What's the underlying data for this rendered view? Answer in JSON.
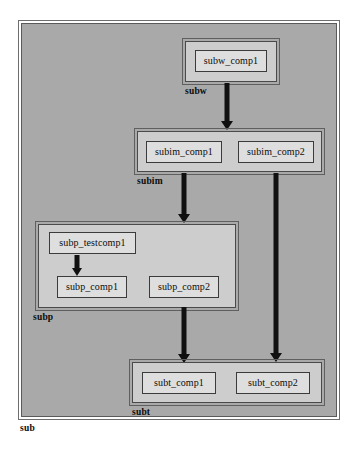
{
  "diagram": {
    "colors": {
      "outer_package_fill": "#a9a9a9",
      "package_fill": "#cdcdcd",
      "component_fill": "#dedede",
      "border": "#3b3b3b",
      "arrow": "#101010",
      "page_background": "#ffffff"
    }
  },
  "packages": {
    "sub": {
      "label": "sub"
    },
    "subw": {
      "label": "subw"
    },
    "subim": {
      "label": "subim"
    },
    "subp": {
      "label": "subp"
    },
    "subt": {
      "label": "subt"
    }
  },
  "components": {
    "subw_comp1": {
      "label": "subw_comp1"
    },
    "subim_comp1": {
      "label": "subim_comp1"
    },
    "subim_comp2": {
      "label": "subim_comp2"
    },
    "subp_testcomp1": {
      "label": "subp_testcomp1"
    },
    "subp_comp1": {
      "label": "subp_comp1"
    },
    "subp_comp2": {
      "label": "subp_comp2"
    },
    "subt_comp1": {
      "label": "subt_comp1"
    },
    "subt_comp2": {
      "label": "subt_comp2"
    }
  },
  "edges": [
    {
      "id": "subw-to-subim",
      "from": "subw_comp1",
      "to": "subim",
      "style": "solid-arrow"
    },
    {
      "id": "subim1-to-subp",
      "from": "subim_comp1",
      "to": "subp",
      "style": "solid-arrow"
    },
    {
      "id": "subim2-to-subt",
      "from": "subim_comp2",
      "to": "subt",
      "style": "solid-arrow"
    },
    {
      "id": "subp-test-to-comp1",
      "from": "subp_testcomp1",
      "to": "subp_comp1",
      "style": "solid-arrow"
    },
    {
      "id": "subp-to-subt",
      "from": "subp",
      "to": "subt",
      "style": "solid-arrow"
    }
  ]
}
